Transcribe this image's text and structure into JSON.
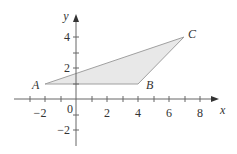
{
  "diagram": {
    "type": "coordinate-plane-triangle",
    "axes": {
      "x_label": "x",
      "y_label": "y",
      "x_ticks": [
        {
          "value": -2,
          "label": "-2"
        },
        {
          "value": 0,
          "label": "0"
        },
        {
          "value": 2,
          "label": "2"
        },
        {
          "value": 4,
          "label": "4"
        },
        {
          "value": 6,
          "label": "6"
        },
        {
          "value": 8,
          "label": "8"
        }
      ],
      "y_ticks": [
        {
          "value": 4,
          "label": "4"
        },
        {
          "value": 2,
          "label": "2"
        },
        {
          "value": -2,
          "label": "-2"
        }
      ],
      "x_range": [
        -3,
        9
      ],
      "y_range": [
        -3,
        5
      ]
    },
    "points": [
      {
        "name": "A",
        "x": -2,
        "y": 1
      },
      {
        "name": "B",
        "x": 4,
        "y": 1
      },
      {
        "name": "C",
        "x": 7,
        "y": 4
      }
    ],
    "fill_color": "#e8e8e8",
    "stroke_color": "#999999",
    "axis_color": "#555555"
  }
}
